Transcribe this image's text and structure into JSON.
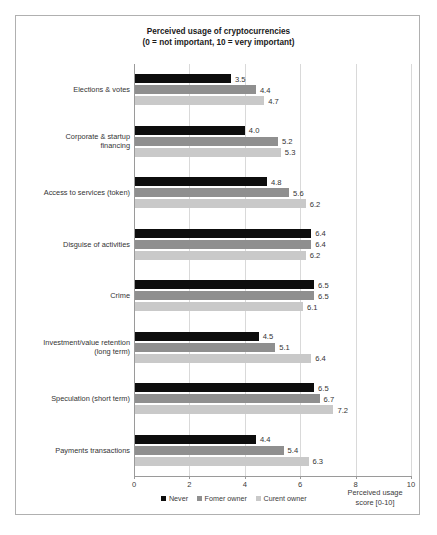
{
  "chart_data": {
    "type": "bar",
    "orientation": "horizontal",
    "title": "Perceived usage of cryptocurrencies",
    "subtitle": "(0 = not important, 10 = very important)",
    "xlabel": "Perceived usage score [0-10]",
    "ylabel": "",
    "xlim": [
      0,
      10
    ],
    "xticks": [
      "0",
      "2",
      "4",
      "6",
      "8",
      "10"
    ],
    "grid": true,
    "legend_position": "bottom",
    "categories": [
      "Elections & votes",
      "Corporate & startup financing",
      "Access to services (token)",
      "Disguise of activities",
      "Crime",
      "Investment/value retention (long term)",
      "Speculation (short term)",
      "Payments transactions"
    ],
    "category_lines": [
      [
        "Elections & votes"
      ],
      [
        "Corporate & startup",
        "financing"
      ],
      [
        "Access to services (token)"
      ],
      [
        "Disguise of activities"
      ],
      [
        "Crime"
      ],
      [
        "Investment/value retention",
        "(long term)"
      ],
      [
        "Speculation (short term)"
      ],
      [
        "Payments transactions"
      ]
    ],
    "series": [
      {
        "name": "Never",
        "color": "#0d0d0d",
        "values": [
          3.5,
          4.0,
          4.8,
          6.4,
          6.5,
          4.5,
          6.5,
          4.4
        ]
      },
      {
        "name": "Fomer owner",
        "color": "#8f8f8f",
        "values": [
          4.4,
          5.2,
          5.6,
          6.4,
          6.5,
          5.1,
          6.7,
          5.4
        ]
      },
      {
        "name": "Curent owner",
        "color": "#c9c9c9",
        "values": [
          4.7,
          5.3,
          6.2,
          6.2,
          6.1,
          6.4,
          7.2,
          6.3
        ]
      }
    ]
  },
  "title": {
    "line1": "Perceived usage of cryptocurrencies",
    "line2": "(0 = not important, 10 = very important)"
  },
  "axis": {
    "x_title_line1": "Perceived usage",
    "x_title_line2": "score [0-10]"
  }
}
